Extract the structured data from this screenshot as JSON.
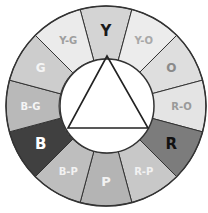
{
  "diagram": {
    "center": [
      106,
      106
    ],
    "outer_radius": 100,
    "inner_radius": 47,
    "segments": [
      {
        "label": "Y",
        "fill": "#d4d4d4",
        "text": "#1a1a1a",
        "size": 15
      },
      {
        "label": "Y-O",
        "fill": "#ececec",
        "text": "#a8a8a8",
        "size": 10
      },
      {
        "label": "O",
        "fill": "#dedede",
        "text": "#8a8a8a",
        "size": 12
      },
      {
        "label": "R-O",
        "fill": "#e4e4e4",
        "text": "#9a9a9a",
        "size": 10
      },
      {
        "label": "R",
        "fill": "#7c7c7c",
        "text": "#111111",
        "size": 15
      },
      {
        "label": "R-P",
        "fill": "#c8c8c8",
        "text": "#f2f2f2",
        "size": 10
      },
      {
        "label": "P",
        "fill": "#b4b4b4",
        "text": "#f2f2f2",
        "size": 13
      },
      {
        "label": "B-P",
        "fill": "#bebebe",
        "text": "#f2f2f2",
        "size": 10
      },
      {
        "label": "B",
        "fill": "#404040",
        "text": "#ffffff",
        "size": 15
      },
      {
        "label": "B-G",
        "fill": "#b9b9b9",
        "text": "#f5f5f5",
        "size": 10
      },
      {
        "label": "G",
        "fill": "#cdcdcd",
        "text": "#f5f5f5",
        "size": 12
      },
      {
        "label": "Y-G",
        "fill": "#ebebeb",
        "text": "#9e9e9e",
        "size": 10
      }
    ],
    "triangle": {
      "points": [
        [
          107,
          56
        ],
        [
          68,
          128
        ],
        [
          148,
          128
        ]
      ],
      "stroke": "#222222"
    },
    "stroke_color": "#333333"
  }
}
